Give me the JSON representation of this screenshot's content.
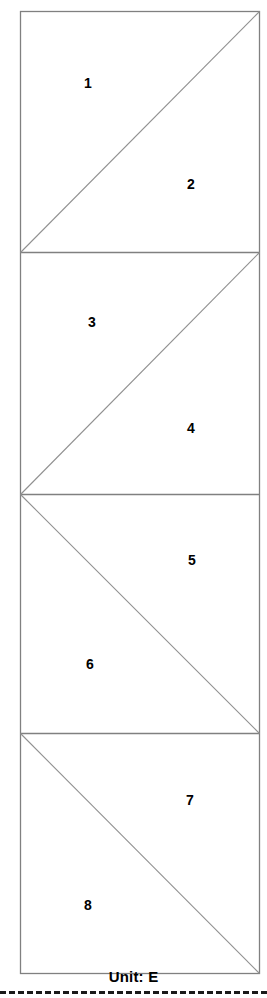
{
  "figure": {
    "title": "",
    "unit_caption": "Unit: E",
    "outline_color": "#808080",
    "divider_color": "#808080",
    "diagonal_color": "#909090",
    "label_color": "#000000",
    "background_color": "#ffffff",
    "dashed_rule_color": "#1a1a1a",
    "frame": {
      "x": 20,
      "y": 11,
      "width": 240,
      "height": 963
    },
    "cells": [
      {
        "index": 1,
        "diagonal": "bottom-left-to-top-right",
        "y_top": 11,
        "y_bottom": 252,
        "regions": [
          {
            "label": "1",
            "x": 88,
            "y": 83,
            "position": "upper-left-triangle"
          },
          {
            "label": "2",
            "x": 191,
            "y": 184,
            "position": "lower-right-triangle"
          }
        ]
      },
      {
        "index": 2,
        "diagonal": "bottom-left-to-top-right",
        "y_top": 252,
        "y_bottom": 494,
        "regions": [
          {
            "label": "3",
            "x": 92,
            "y": 322,
            "position": "upper-left-triangle"
          },
          {
            "label": "4",
            "x": 191,
            "y": 428,
            "position": "lower-right-triangle"
          }
        ]
      },
      {
        "index": 3,
        "diagonal": "top-left-to-bottom-right",
        "y_top": 494,
        "y_bottom": 733,
        "regions": [
          {
            "label": "5",
            "x": 192,
            "y": 560,
            "position": "upper-right-triangle"
          },
          {
            "label": "6",
            "x": 90,
            "y": 664,
            "position": "lower-left-triangle"
          }
        ]
      },
      {
        "index": 4,
        "diagonal": "top-left-to-bottom-right",
        "y_top": 733,
        "y_bottom": 974,
        "regions": [
          {
            "label": "7",
            "x": 190,
            "y": 800,
            "position": "upper-right-triangle"
          },
          {
            "label": "8",
            "x": 88,
            "y": 905,
            "position": "lower-left-triangle"
          }
        ]
      }
    ],
    "labels": [
      "1",
      "2",
      "3",
      "4",
      "5",
      "6",
      "7",
      "8"
    ]
  }
}
